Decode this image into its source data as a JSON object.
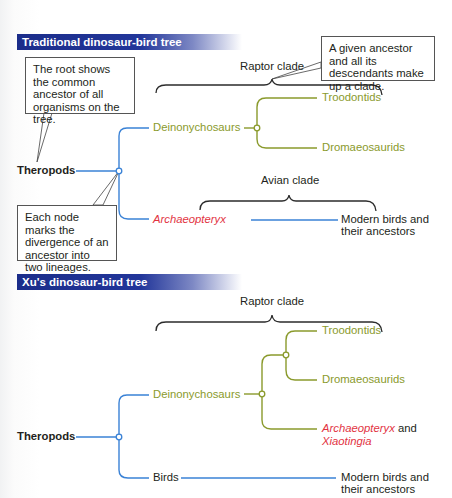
{
  "colors": {
    "header_bg": "#1b2d8a",
    "blue_line": "#3a82d6",
    "green_line": "#8a9a2c",
    "red_text": "#e2333f",
    "text": "#231f20"
  },
  "traditional": {
    "header": "Traditional dinosaur-bird tree",
    "callout_root": "The root shows the common ancestor of all organisms on the tree.",
    "callout_clade": "A given ancestor and all its descendants make up a clade.",
    "callout_node": "Each node marks the divergence of an ancestor into two lineages.",
    "raptor_clade": "Raptor clade",
    "avian_clade": "Avian clade",
    "root": "Theropods",
    "deinonychosaurs": "Deinonychosaurs",
    "troodontids": "Troodontids",
    "dromaeosaurids": "Dromaeosaurids",
    "archaeopteryx": "Archaeopteryx",
    "modern_birds_line1": "Modern birds and",
    "modern_birds_line2": "their ancestors"
  },
  "xu": {
    "header": "Xu's dinosaur-bird tree",
    "raptor_clade": "Raptor clade",
    "root": "Theropods",
    "deinonychosaurs": "Deinonychosaurs",
    "troodontids": "Troodontids",
    "dromaeosaurids": "Dromaeosaurids",
    "archaeopteryx": "Archaeopteryx",
    "and": " and",
    "xiaotingia": "Xiaotingia",
    "birds": "Birds",
    "modern_birds_line1": "Modern birds and",
    "modern_birds_line2": "their ancestors"
  }
}
